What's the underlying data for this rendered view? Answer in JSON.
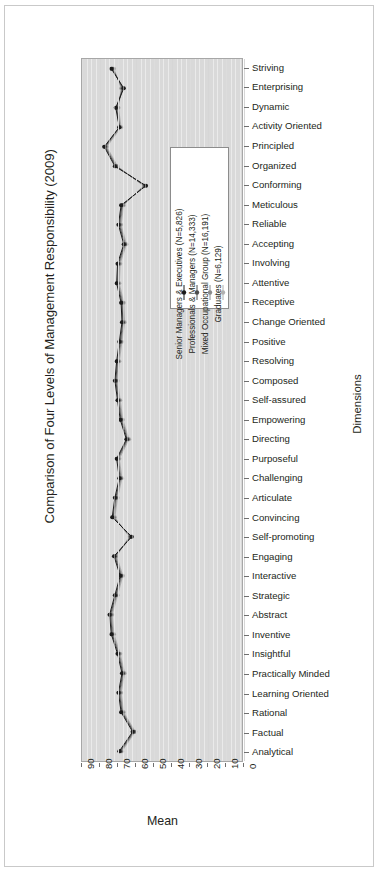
{
  "chart_data": {
    "type": "line",
    "title": "Comparison of Four Levels of Management Responsibility (2009)",
    "xlabel": "Mean",
    "ylabel": "Dimensions",
    "orientation": "horizontal",
    "xlim": [
      90,
      0
    ],
    "x_reversed": true,
    "xticks": [
      90,
      80,
      70,
      60,
      50,
      40,
      30,
      20,
      10,
      0
    ],
    "grid": true,
    "legend_position": "inside-upper-right",
    "categories": [
      "Striving",
      "Enterprising",
      "Dynamic",
      "Activity Oriented",
      "Principled",
      "Organized",
      "Conforming",
      "Meticulous",
      "Reliable",
      "Accepting",
      "Involving",
      "Attentive",
      "Receptive",
      "Change Oriented",
      "Positive",
      "Resolving",
      "Composed",
      "Self-assured",
      "Empowering",
      "Directing",
      "Purposeful",
      "Challenging",
      "Articulate",
      "Convincing",
      "Self-promoting",
      "Engaging",
      "Interactive",
      "Strategic",
      "Abstract",
      "Inventive",
      "Insightful",
      "Practically Minded",
      "Learning Oriented",
      "Rational",
      "Factual",
      "Analytical"
    ],
    "series": [
      {
        "name": "Senior Managers & Executives (N=5,826)",
        "color": "#1a1a1a",
        "values": [
          73.5,
          66.5,
          71.0,
          69.0,
          77.5,
          71.5,
          54.0,
          68.0,
          69.5,
          66.5,
          70.0,
          70.5,
          68.0,
          67.5,
          69.0,
          70.5,
          71.5,
          70.0,
          68.5,
          65.0,
          70.5,
          69.0,
          71.5,
          73.0,
          62.0,
          72.0,
          68.5,
          71.5,
          74.5,
          73.5,
          70.0,
          67.5,
          69.5,
          68.0,
          61.5,
          69.0
        ]
      },
      {
        "name": "Professionals & Managers (N=14,333)",
        "color": "#4d4d4d",
        "values": [
          73.0,
          67.0,
          70.5,
          69.0,
          77.0,
          71.0,
          54.5,
          67.5,
          69.0,
          66.0,
          69.5,
          70.0,
          67.5,
          67.0,
          68.5,
          70.0,
          71.0,
          69.5,
          68.0,
          64.5,
          70.0,
          68.5,
          71.0,
          72.5,
          62.5,
          71.5,
          68.0,
          71.0,
          74.0,
          73.0,
          69.5,
          67.0,
          69.0,
          67.5,
          61.0,
          68.5
        ]
      },
      {
        "name": "Mixed Occupational Group (N=16,191)",
        "color": "#8c8c8c",
        "values": [
          72.5,
          67.5,
          70.0,
          68.5,
          76.5,
          70.5,
          55.0,
          67.0,
          68.5,
          65.5,
          69.0,
          69.5,
          67.0,
          66.5,
          68.0,
          69.5,
          70.5,
          69.0,
          67.5,
          64.0,
          69.5,
          68.0,
          70.5,
          72.0,
          63.0,
          71.0,
          67.5,
          70.5,
          73.5,
          72.5,
          69.0,
          66.5,
          68.5,
          67.0,
          60.5,
          68.0
        ]
      },
      {
        "name": "Graduates (N=6,129)",
        "color": "#b0b0b0",
        "values": [
          72.0,
          68.0,
          69.5,
          68.0,
          76.0,
          70.0,
          55.5,
          66.5,
          68.0,
          65.0,
          68.5,
          69.0,
          66.5,
          66.0,
          67.5,
          69.0,
          70.0,
          68.5,
          67.0,
          63.5,
          69.0,
          67.5,
          70.0,
          71.5,
          63.5,
          70.5,
          67.0,
          70.0,
          73.0,
          72.0,
          68.5,
          66.0,
          68.0,
          66.5,
          60.0,
          67.5
        ]
      }
    ]
  },
  "legend": {
    "entries": [
      "Senior Managers & Executives (N=5,826)",
      "Professionals & Managers (N=14,333)",
      "Mixed Occupational Group (N=16,191)",
      "Graduates (N=6,129)"
    ]
  }
}
